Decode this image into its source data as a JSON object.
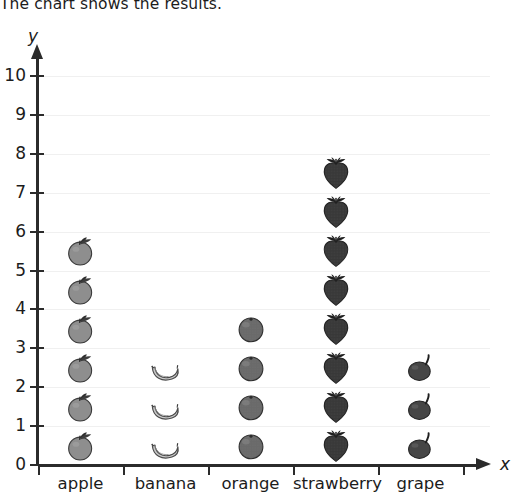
{
  "title": "The chart shows the results.",
  "axes": {
    "y_label": "y",
    "x_label": "x",
    "y_ticks": [
      "0",
      "1",
      "2",
      "3",
      "4",
      "5",
      "6",
      "7",
      "8",
      "9",
      "10"
    ]
  },
  "chart_data": {
    "type": "bar",
    "subtype": "pictograph",
    "title": "The chart shows the results.",
    "categories": [
      "apple",
      "banana",
      "orange",
      "strawberry",
      "grape"
    ],
    "values": [
      6,
      3,
      4,
      8,
      3
    ],
    "icons": [
      "apple-icon",
      "banana-icon",
      "orange-icon",
      "strawberry-icon",
      "grape-icon"
    ],
    "xlabel": "x",
    "ylabel": "y",
    "ylim": [
      0,
      10
    ],
    "ytick_step": 1,
    "grid": true,
    "legend": "none",
    "icon_unit_value": 1,
    "colors": {
      "apple": "#8e8e8e",
      "banana": "#c9c9c9",
      "orange": "#6a6a6a",
      "strawberry": "#383838",
      "grape": "#464646",
      "axis": "#2b2b2b",
      "gridline": "#f0f0f0",
      "text": "#1c1c1c"
    }
  }
}
